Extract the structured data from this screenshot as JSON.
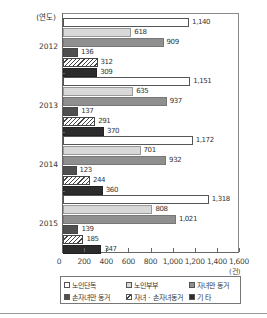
{
  "chart_data": {
    "type": "bar",
    "orientation": "horizontal",
    "title": "",
    "xlabel": "(건)",
    "ylabel": "(연도)",
    "xlim": [
      0,
      1600
    ],
    "xticks": [
      "0",
      "200",
      "400",
      "600",
      "800",
      "1,000",
      "1,200",
      "1,400",
      "1,600"
    ],
    "categories": [
      "2012",
      "2013",
      "2014",
      "2015"
    ],
    "series": [
      {
        "name": "노인단독",
        "values": [
          1140,
          1151,
          1172,
          1318
        ],
        "labels": [
          "1,140",
          "1,151",
          "1,172",
          "1,318"
        ],
        "color": "#ffffff"
      },
      {
        "name": "노인부부",
        "values": [
          618,
          635,
          701,
          808
        ],
        "labels": [
          "618",
          "635",
          "701",
          "808"
        ],
        "color": "#d8d8d8"
      },
      {
        "name": "자녀만 동거",
        "values": [
          909,
          937,
          932,
          1021
        ],
        "labels": [
          "909",
          "937",
          "932",
          "1,021"
        ],
        "color": "#8f8f8f"
      },
      {
        "name": "손자녀만 동거",
        "values": [
          136,
          137,
          123,
          139
        ],
        "labels": [
          "136",
          "137",
          "123",
          "139"
        ],
        "color": "#4f4f4f"
      },
      {
        "name": "자녀 · 손자녀동거",
        "values": [
          312,
          291,
          244,
          185
        ],
        "labels": [
          "312",
          "291",
          "244",
          "185"
        ],
        "color": "hatched"
      },
      {
        "name": "기 타",
        "values": [
          309,
          370,
          360,
          347
        ],
        "labels": [
          "309",
          "370",
          "360",
          "347"
        ],
        "color": "#2c2c2c"
      }
    ],
    "grid": false,
    "legend_position": "bottom"
  },
  "axis": {
    "y_title": "(연도)",
    "unit": "(건)",
    "ticks": [
      "0",
      "200",
      "400",
      "600",
      "800",
      "1,000",
      "1,200",
      "1,400",
      "1,600"
    ]
  },
  "legend": {
    "items": [
      "노인단독",
      "노인부부",
      "자녀만 동거",
      "손자녀만 동거",
      "자녀 · 손자녀동거",
      "기 타"
    ]
  }
}
